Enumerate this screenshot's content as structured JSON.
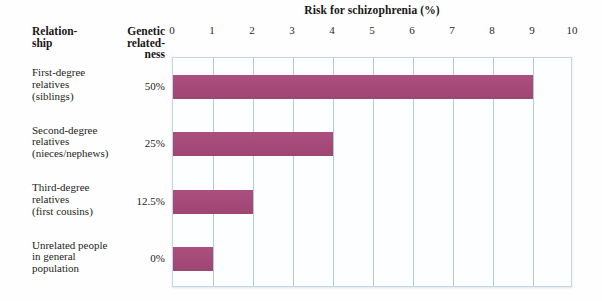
{
  "figure": {
    "title": "Risk for schizophrenia (%)",
    "columns": {
      "relationship_header": [
        "Relation-",
        "ship"
      ],
      "relatedness_header": [
        "Genetic",
        "related-",
        "ness"
      ]
    }
  },
  "chart_data": {
    "type": "bar",
    "orientation": "horizontal",
    "title": "Risk for schizophrenia (%)",
    "xlabel": "Risk for schizophrenia (%)",
    "ylabel": "Relationship",
    "xlim": [
      0,
      10
    ],
    "xticks": [
      0,
      1,
      2,
      3,
      4,
      5,
      6,
      7,
      8,
      9,
      10
    ],
    "xtick_labels": [
      "0",
      "1",
      "2",
      "3",
      "4",
      "5",
      "6",
      "7",
      "8",
      "9",
      "10"
    ],
    "grid": true,
    "grid_axis": "x",
    "legend": null,
    "bar_color": "#a8497c",
    "grid_color": "#aecae0",
    "frame_color": "#c3d4e3",
    "categories": [
      "First-degree relatives (siblings)",
      "Second-degree relatives (nieces/nephews)",
      "Third-degree relatives (first cousins)",
      "Unrelated people in general population"
    ],
    "values": [
      9,
      4,
      2,
      1
    ],
    "series": [
      {
        "name": "Risk for schizophrenia (%)",
        "values": [
          9,
          4,
          2,
          1
        ]
      }
    ],
    "secondary_column": {
      "name": "Genetic relatedness",
      "values": [
        "50%",
        "25%",
        "12.5%",
        "0%"
      ]
    },
    "rows": [
      {
        "label_lines": [
          "First-degree",
          "relatives",
          "(siblings)"
        ],
        "relatedness": "50%",
        "risk": 9
      },
      {
        "label_lines": [
          "Second-degree",
          "relatives",
          "(nieces/nephews)"
        ],
        "relatedness": "25%",
        "risk": 4
      },
      {
        "label_lines": [
          "Third-degree",
          "relatives",
          "(first cousins)"
        ],
        "relatedness": "12.5%",
        "risk": 2
      },
      {
        "label_lines": [
          "Unrelated people",
          "in general",
          "population"
        ],
        "relatedness": "0%",
        "risk": 1
      }
    ]
  }
}
